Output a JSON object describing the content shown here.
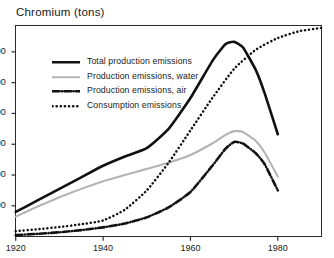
{
  "chart_data": {
    "type": "line",
    "title": "Chromium  (tons)",
    "xlabel": "",
    "ylabel": "tons",
    "xlim": [
      1920,
      1990
    ],
    "ylim": [
      0,
      1370
    ],
    "grid": false,
    "legend_position": "upper-left-inside",
    "xticks": [
      "1920",
      "1940",
      "1960",
      "1980"
    ],
    "xtick_values": [
      1920,
      1940,
      1960,
      1980
    ],
    "yticks": [
      "200",
      "400",
      "600",
      "800",
      "1,000",
      "1,200"
    ],
    "ytick_values": [
      200,
      400,
      600,
      800,
      1000,
      1200
    ],
    "x": [
      1920,
      1925,
      1930,
      1935,
      1940,
      1945,
      1950,
      1955,
      1960,
      1965,
      1968,
      1970,
      1972,
      1975,
      1977,
      1980
    ],
    "series": [
      {
        "name": "Total production emissions",
        "style": "solid",
        "color": "#111111",
        "width": 2.6,
        "x": [
          1920,
          1925,
          1930,
          1935,
          1940,
          1945,
          1950,
          1955,
          1960,
          1965,
          1968,
          1970,
          1972,
          1975,
          1977,
          1980
        ],
        "values": [
          160,
          235,
          310,
          385,
          460,
          520,
          575,
          700,
          900,
          1140,
          1250,
          1265,
          1230,
          1080,
          930,
          665
        ]
      },
      {
        "name": "Production emissions, water",
        "style": "solid",
        "color": "#b4b4b4",
        "width": 2.1,
        "x": [
          1920,
          1925,
          1930,
          1935,
          1940,
          1945,
          1950,
          1955,
          1960,
          1965,
          1968,
          1970,
          1972,
          1975,
          1977,
          1980
        ],
        "values": [
          130,
          195,
          255,
          310,
          360,
          400,
          440,
          480,
          530,
          605,
          660,
          685,
          680,
          620,
          545,
          390
        ]
      },
      {
        "name": "Production emissions, air",
        "style": "dashdot",
        "color": "#111111",
        "width": 2.6,
        "x": [
          1920,
          1925,
          1930,
          1935,
          1940,
          1945,
          1950,
          1955,
          1960,
          1965,
          1968,
          1970,
          1972,
          1975,
          1977,
          1980
        ],
        "values": [
          10,
          18,
          28,
          42,
          60,
          85,
          125,
          190,
          290,
          460,
          570,
          615,
          605,
          540,
          470,
          300
        ]
      },
      {
        "name": "Consumption emissions",
        "style": "dotted",
        "color": "#111111",
        "width": 2.5,
        "x": [
          1920,
          1925,
          1930,
          1935,
          1940,
          1945,
          1950,
          1955,
          1960,
          1965,
          1970,
          1975,
          1980,
          1985,
          1990
        ],
        "values": [
          35,
          48,
          62,
          80,
          105,
          175,
          300,
          480,
          690,
          900,
          1090,
          1215,
          1290,
          1335,
          1355
        ]
      }
    ]
  },
  "legend": {
    "items": [
      {
        "label": "Total production emissions",
        "style": "solid",
        "color": "#111111"
      },
      {
        "label": "Production emissions, water",
        "style": "solid",
        "color": "#b4b4b4"
      },
      {
        "label": "Production emissions, air",
        "style": "dashdot",
        "color": "#111111"
      },
      {
        "label": "Consumption emissions",
        "style": "dotted",
        "color": "#111111"
      }
    ]
  },
  "colors": {
    "frame": "#2b2b2b",
    "text": "#1a1a1a",
    "background": "#ffffff",
    "series_dark": "#111111",
    "series_gray": "#b4b4b4"
  }
}
